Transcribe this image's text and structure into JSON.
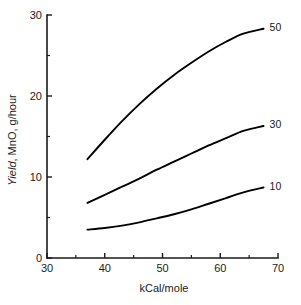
{
  "chart_data": {
    "type": "line",
    "title": "",
    "xlabel": "kCal/mole",
    "ylabel": "Yield, MnO, g/hour",
    "ylabel_emphasis": "Yield",
    "ylabel_rest": ", MnO, g/hour",
    "xlim": [
      30,
      70
    ],
    "ylim": [
      0,
      30
    ],
    "grid": false,
    "legend_position": "right-end-labels",
    "x_ticks_major": [
      30,
      40,
      50,
      60,
      70
    ],
    "x_ticks_minor": [
      35,
      45,
      55,
      65
    ],
    "y_ticks_major": [
      0,
      10,
      20,
      30
    ],
    "y_ticks_minor": [
      5,
      15,
      25
    ],
    "x_tick_labels": [
      "30",
      "40",
      "50",
      "60",
      "70"
    ],
    "y_tick_labels": [
      "0",
      "10",
      "20",
      "30"
    ],
    "series": [
      {
        "name": "50",
        "label": "50",
        "color": "#000000",
        "x": [
          37.0,
          40.0,
          43.0,
          46.0,
          49.0,
          52.0,
          55.0,
          58.0,
          61.0,
          64.0,
          67.5
        ],
        "values": [
          12.2,
          14.6,
          16.9,
          19.0,
          20.9,
          22.6,
          24.1,
          25.5,
          26.7,
          27.7,
          28.3
        ]
      },
      {
        "name": "30",
        "label": "30",
        "color": "#000000",
        "x": [
          37.0,
          40.0,
          43.0,
          46.0,
          49.0,
          52.0,
          55.0,
          58.0,
          61.0,
          64.0,
          67.5
        ],
        "values": [
          6.8,
          7.8,
          8.8,
          9.8,
          10.9,
          11.9,
          12.9,
          13.9,
          14.8,
          15.7,
          16.3
        ]
      },
      {
        "name": "10",
        "label": "10",
        "color": "#000000",
        "x": [
          37.0,
          40.0,
          43.0,
          46.0,
          49.0,
          52.0,
          55.0,
          58.0,
          61.0,
          64.0,
          67.5
        ],
        "values": [
          3.5,
          3.7,
          4.0,
          4.4,
          4.9,
          5.4,
          6.0,
          6.7,
          7.4,
          8.1,
          8.7
        ]
      }
    ]
  },
  "plot_geometry": {
    "x_px_min": 47,
    "x_px_max": 278,
    "y_px_min": 258,
    "y_px_max": 15,
    "major_tick_len": 5,
    "minor_tick_len": 3
  }
}
